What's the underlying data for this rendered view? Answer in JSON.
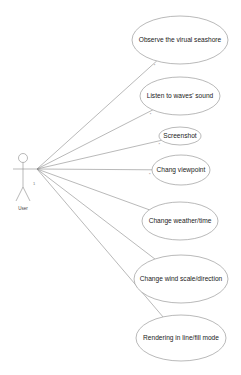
{
  "diagram": {
    "type": "uml-use-case",
    "actor": {
      "label": "User",
      "x": 23,
      "head_y": 158,
      "arm_y": 169,
      "anchor": [
        37,
        169
      ]
    },
    "use_cases": [
      {
        "label": "Observe the virual seashore",
        "cx": 180,
        "cy": 40,
        "rx": 48,
        "ry": 24,
        "mult": "*"
      },
      {
        "label": "Listen to waves' sound",
        "cx": 180,
        "cy": 96,
        "rx": 40,
        "ry": 19,
        "mult": "*"
      },
      {
        "label": "Screenshot",
        "cx": 180,
        "cy": 136,
        "rx": 21,
        "ry": 9,
        "mult": "*"
      },
      {
        "label": "Chang viewpoint",
        "cx": 181,
        "cy": 170,
        "rx": 29,
        "ry": 15,
        "mult": "*"
      },
      {
        "label": "Change weather/time",
        "cx": 180,
        "cy": 221,
        "rx": 38,
        "ry": 19,
        "mult": "*"
      },
      {
        "label": "Change wind scale/direction",
        "cx": 181,
        "cy": 279,
        "rx": 47,
        "ry": 24,
        "mult": "*"
      },
      {
        "label": "Rendering in line/fill mode",
        "cx": 181,
        "cy": 338,
        "rx": 45,
        "ry": 23,
        "mult": "*"
      }
    ],
    "actor_multiplicity": "1",
    "colors": {
      "stroke": "#8a8a8a",
      "text": "#222222",
      "background": "#ffffff"
    }
  }
}
